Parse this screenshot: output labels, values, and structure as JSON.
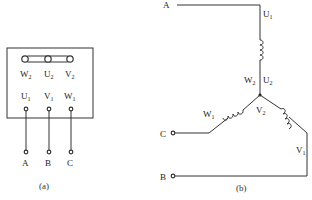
{
  "panel_a": {
    "caption": "(a)",
    "top_row": [
      {
        "label": "W",
        "sub": "2"
      },
      {
        "label": "U",
        "sub": "2"
      },
      {
        "label": "V",
        "sub": "2"
      }
    ],
    "bottom_row": [
      {
        "label": "U",
        "sub": "1"
      },
      {
        "label": "V",
        "sub": "1"
      },
      {
        "label": "W",
        "sub": "1"
      }
    ],
    "leads": [
      "A",
      "B",
      "C"
    ]
  },
  "panel_b": {
    "caption": "(b)",
    "line_a": "A",
    "line_b": "B",
    "line_c": "C",
    "u1": {
      "label": "U",
      "sub": "1"
    },
    "w2": {
      "label": "W",
      "sub": "2"
    },
    "u2": {
      "label": "U",
      "sub": "2"
    },
    "v2": {
      "label": "V",
      "sub": "2"
    },
    "w1": {
      "label": "W",
      "sub": "1"
    },
    "v1": {
      "label": "V",
      "sub": "1"
    }
  }
}
